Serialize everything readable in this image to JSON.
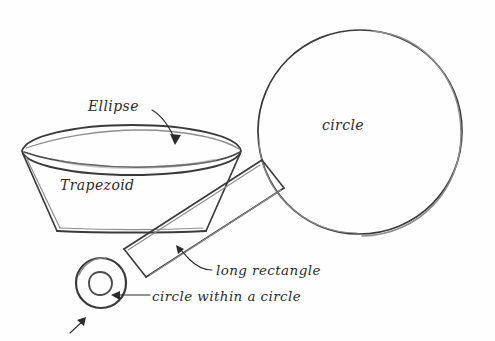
{
  "drawing": {
    "title": "Hand-drawn geometric shape breakdown sketch",
    "medium": "pencil on white paper",
    "background_color": "#fefefe",
    "ink_color": "#4a4a4a",
    "text_color": "#2b2b2b"
  },
  "labels": {
    "ellipse": "Ellipse",
    "trapezoid": "Trapezoid",
    "circle": "circle",
    "long_rectangle": "long rectangle",
    "circle_within_circle": "circle within a circle"
  },
  "shapes": [
    {
      "name": "ellipse-rim",
      "label": "Ellipse",
      "description": "flattened ellipse forming the open top rim of the bowl",
      "center": [
        131,
        152
      ],
      "radius_x": 110,
      "radius_y": 19
    },
    {
      "name": "trapezoid-body",
      "label": "Trapezoid",
      "description": "tapered bowl body below the ellipse rim",
      "top_left": [
        22,
        152
      ],
      "top_right": [
        241,
        152
      ],
      "bottom_left": [
        57,
        231
      ],
      "bottom_right": [
        205,
        231
      ]
    },
    {
      "name": "large-circle",
      "label": "circle",
      "description": "large circle at upper right",
      "center": [
        360,
        132
      ],
      "radius": 102
    },
    {
      "name": "long-rectangle-handle",
      "label": "long rectangle",
      "description": "long narrow rectangle angled from the small circle up to the large circle",
      "corner_a": [
        124,
        248
      ],
      "corner_b": [
        146,
        276
      ],
      "corner_c": [
        283,
        187
      ],
      "corner_d": [
        262,
        160
      ]
    },
    {
      "name": "circle-within-a-circle",
      "label": "circle within a circle",
      "description": "small wheel of two concentric circles at lower left",
      "center": [
        101,
        283
      ],
      "outer_radius": 25,
      "inner_radius": 11
    },
    {
      "name": "small-corner-arrow",
      "label": "",
      "description": "small stray arrow glyph pointing up-right near bottom left",
      "from": [
        70,
        333
      ],
      "to": [
        84,
        319
      ]
    }
  ],
  "annotations": [
    {
      "name": "ellipse-annotation",
      "text": "Ellipse",
      "text_position": [
        88,
        111
      ],
      "leader_from": [
        155,
        107
      ],
      "leader_to": [
        172,
        141
      ],
      "arrow": true
    },
    {
      "name": "trapezoid-annotation",
      "text": "Trapezoid",
      "text_position": [
        60,
        190
      ],
      "leader_from": null,
      "leader_to": null,
      "arrow": false
    },
    {
      "name": "circle-annotation",
      "text": "circle",
      "text_position": [
        322,
        130
      ],
      "leader_from": null,
      "leader_to": null,
      "arrow": false
    },
    {
      "name": "long-rectangle-annotation",
      "text": "long rectangle",
      "text_position": [
        216,
        274
      ],
      "leader_from": [
        211,
        270
      ],
      "leader_to": [
        178,
        250
      ],
      "arrow": true
    },
    {
      "name": "circle-within-a-circle-annotation",
      "text": "circle within a circle",
      "text_position": [
        152,
        300
      ],
      "leader_from": [
        148,
        295
      ],
      "leader_to": [
        113,
        295
      ],
      "arrow": true
    }
  ]
}
